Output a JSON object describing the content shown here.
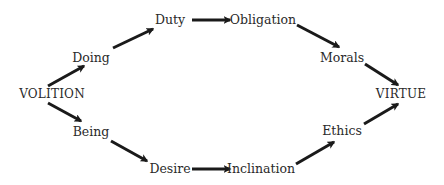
{
  "diagram": {
    "nodes": [
      {
        "id": "volition",
        "label": "VOLITION",
        "x": 52,
        "y": 94
      },
      {
        "id": "doing",
        "label": "Doing",
        "x": 91,
        "y": 58
      },
      {
        "id": "duty",
        "label": "Duty",
        "x": 170,
        "y": 20
      },
      {
        "id": "obligation",
        "label": "Obligation",
        "x": 263,
        "y": 20
      },
      {
        "id": "morals",
        "label": "Morals",
        "x": 342,
        "y": 58
      },
      {
        "id": "virtue",
        "label": "VIRTUE",
        "x": 401,
        "y": 94
      },
      {
        "id": "being",
        "label": "Being",
        "x": 91,
        "y": 132
      },
      {
        "id": "desire",
        "label": "Desire",
        "x": 170,
        "y": 169
      },
      {
        "id": "inclination",
        "label": "Inclination",
        "x": 261,
        "y": 169
      },
      {
        "id": "ethics",
        "label": "Ethics",
        "x": 342,
        "y": 131
      }
    ],
    "edges": [
      {
        "from": "volition",
        "to": "doing",
        "x1": 48,
        "y1": 86,
        "x2": 84,
        "y2": 66
      },
      {
        "from": "doing",
        "to": "duty",
        "x1": 113,
        "y1": 48,
        "x2": 153,
        "y2": 29
      },
      {
        "from": "duty",
        "to": "obligation",
        "x1": 192,
        "y1": 20,
        "x2": 230,
        "y2": 20
      },
      {
        "from": "obligation",
        "to": "morals",
        "x1": 297,
        "y1": 25,
        "x2": 339,
        "y2": 47
      },
      {
        "from": "morals",
        "to": "virtue",
        "x1": 365,
        "y1": 64,
        "x2": 398,
        "y2": 85
      },
      {
        "from": "volition",
        "to": "being",
        "x1": 48,
        "y1": 103,
        "x2": 81,
        "y2": 121
      },
      {
        "from": "being",
        "to": "desire",
        "x1": 111,
        "y1": 141,
        "x2": 147,
        "y2": 161
      },
      {
        "from": "desire",
        "to": "inclination",
        "x1": 192,
        "y1": 169,
        "x2": 230,
        "y2": 169
      },
      {
        "from": "inclination",
        "to": "ethics",
        "x1": 296,
        "y1": 164,
        "x2": 334,
        "y2": 142
      },
      {
        "from": "ethics",
        "to": "virtue",
        "x1": 364,
        "y1": 124,
        "x2": 398,
        "y2": 104
      }
    ],
    "colors": {
      "text": "#2a2a2a",
      "arrow": "#1a1a1a",
      "background": "#ffffff"
    }
  }
}
